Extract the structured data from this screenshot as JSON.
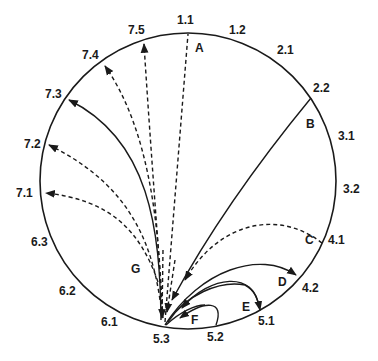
{
  "diagram": {
    "type": "circular-transition-diagram",
    "hub": "5.3",
    "rim_labels": [
      {
        "id": "1.1",
        "x": 177,
        "y": 24
      },
      {
        "id": "1.2",
        "x": 229,
        "y": 34
      },
      {
        "id": "2.1",
        "x": 277,
        "y": 54
      },
      {
        "id": "2.2",
        "x": 313,
        "y": 92
      },
      {
        "id": "3.1",
        "x": 338,
        "y": 140
      },
      {
        "id": "3.2",
        "x": 343,
        "y": 193
      },
      {
        "id": "4.1",
        "x": 328,
        "y": 244
      },
      {
        "id": "4.2",
        "x": 302,
        "y": 292
      },
      {
        "id": "5.1",
        "x": 258,
        "y": 325
      },
      {
        "id": "5.2",
        "x": 207,
        "y": 341
      },
      {
        "id": "5.3",
        "x": 153,
        "y": 343
      },
      {
        "id": "6.1",
        "x": 101,
        "y": 326
      },
      {
        "id": "6.2",
        "x": 59,
        "y": 295
      },
      {
        "id": "6.3",
        "x": 31,
        "y": 246
      },
      {
        "id": "7.1",
        "x": 16,
        "y": 197
      },
      {
        "id": "7.2",
        "x": 24,
        "y": 148
      },
      {
        "id": "7.3",
        "x": 45,
        "y": 98
      },
      {
        "id": "7.4",
        "x": 82,
        "y": 59
      },
      {
        "id": "7.5",
        "x": 128,
        "y": 34
      }
    ],
    "path_labels": [
      {
        "id": "A",
        "x": 195,
        "y": 52
      },
      {
        "id": "B",
        "x": 306,
        "y": 128
      },
      {
        "id": "C",
        "x": 305,
        "y": 244
      },
      {
        "id": "D",
        "x": 278,
        "y": 286
      },
      {
        "id": "E",
        "x": 242,
        "y": 311
      },
      {
        "id": "F",
        "x": 191,
        "y": 324
      },
      {
        "id": "G",
        "x": 131,
        "y": 273
      }
    ],
    "paths": [
      {
        "label": "A",
        "from": "5.3",
        "to": "1.1",
        "style": "dashed"
      },
      {
        "label": "B",
        "from": "2.2",
        "to": "5.3",
        "style": "solid"
      },
      {
        "label": "C",
        "from": "4.1",
        "to": "5.3",
        "style": "dashed"
      },
      {
        "label": "D",
        "from": "5.3",
        "to": "4.2",
        "style": "solid"
      },
      {
        "label": "E",
        "from": "5.1",
        "to": "5.3",
        "style": "solid"
      },
      {
        "label": "F",
        "from": "5.2",
        "to": "5.3",
        "style": "solid"
      },
      {
        "label": "G",
        "from": "5.3",
        "to": "7.1",
        "style": "dashed"
      },
      {
        "label": "G",
        "from": "5.3",
        "to": "7.2",
        "style": "dashed"
      },
      {
        "label": "G",
        "from": "5.3",
        "to": "7.3",
        "style": "solid"
      },
      {
        "label": "G",
        "from": "5.3",
        "to": "7.4",
        "style": "dashed"
      },
      {
        "label": "G",
        "from": "5.3",
        "to": "7.5",
        "style": "dashed"
      }
    ]
  }
}
